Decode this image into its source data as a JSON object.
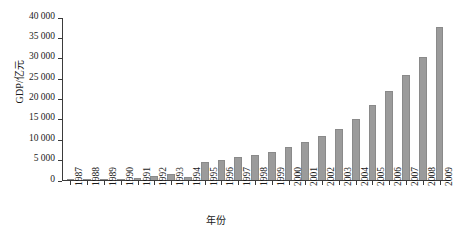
{
  "chart_data": {
    "type": "bar",
    "title": "",
    "xlabel": "年份",
    "ylabel": "GDP/亿元",
    "categories": [
      "1987",
      "1988",
      "1989",
      "1990",
      "1991",
      "1992",
      "1993",
      "1994",
      "1995",
      "1996",
      "1997",
      "1998",
      "1999",
      "2000",
      "2001",
      "2002",
      "2003",
      "2004",
      "2005",
      "2006",
      "2007",
      "2008",
      "2009"
    ],
    "values": [
      120,
      190,
      240,
      300,
      580,
      900,
      1450,
      620,
      4300,
      5000,
      5600,
      6100,
      6900,
      8200,
      9400,
      10700,
      12400,
      15000,
      18300,
      21800,
      25700,
      30300,
      37500
    ],
    "series": [
      {
        "name": "GDP",
        "values": [
          120,
          190,
          240,
          300,
          580,
          900,
          1450,
          620,
          4300,
          5000,
          5600,
          6100,
          6900,
          8200,
          9400,
          10700,
          12400,
          15000,
          18300,
          21800,
          25700,
          30300,
          37500
        ]
      }
    ],
    "ylim": [
      0,
      40000
    ],
    "ytick_values": [
      0,
      5000,
      10000,
      15000,
      20000,
      25000,
      30000,
      35000,
      40000
    ],
    "ytick_labels": [
      "0",
      "5 000",
      "10 000",
      "15 000",
      "20 000",
      "25 000",
      "30 000",
      "35 000",
      "40 000"
    ],
    "grid": false,
    "legend": false,
    "bar_color": "#9b9b9b",
    "axis_color": "#3b3b3b",
    "background": "#ffffff"
  }
}
